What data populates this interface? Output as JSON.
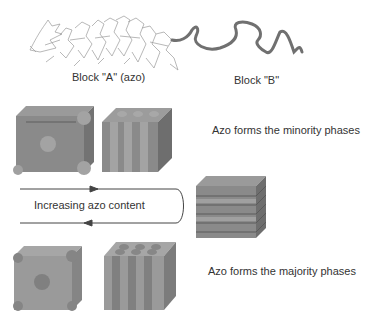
{
  "polymer": {
    "block_a_label": "Block \"A\" (azo)",
    "block_b_label": "Block \"B\""
  },
  "phases": {
    "minority_label": "Azo forms the minority phases",
    "majority_label": "Azo forms the majority phases",
    "arrow_label": "Increasing azo content"
  },
  "colors": {
    "cube_face": "#8a8a8a",
    "cube_light": "#a3a3a3",
    "cube_dark": "#6e6e6e",
    "line": "#444444"
  }
}
